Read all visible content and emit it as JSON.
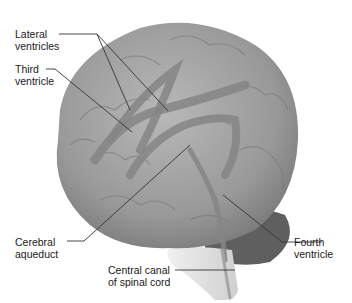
{
  "figure": {
    "colors": {
      "brain": "#9a9a9a",
      "brain_light": "#c4c4c4",
      "brain_dark": "#6e6e6e",
      "cerebellum": "#5f5f5f",
      "brainstem": "#e2e2e2",
      "ventricle": "#8a8a8a",
      "leader_line": "#333333",
      "text": "#1a1a1a"
    }
  },
  "labels": {
    "lateral_ventricles": {
      "line1": "Lateral",
      "line2": "ventricles"
    },
    "third_ventricle": {
      "line1": "Third",
      "line2": "ventricle"
    },
    "cerebral_aqueduct": {
      "line1": "Cerebral",
      "line2": "aqueduct"
    },
    "fourth_ventricle": {
      "line1": "Fourth",
      "line2": "ventricle"
    },
    "central_canal": {
      "line1": "Central canal",
      "line2": "of spinal cord"
    }
  }
}
